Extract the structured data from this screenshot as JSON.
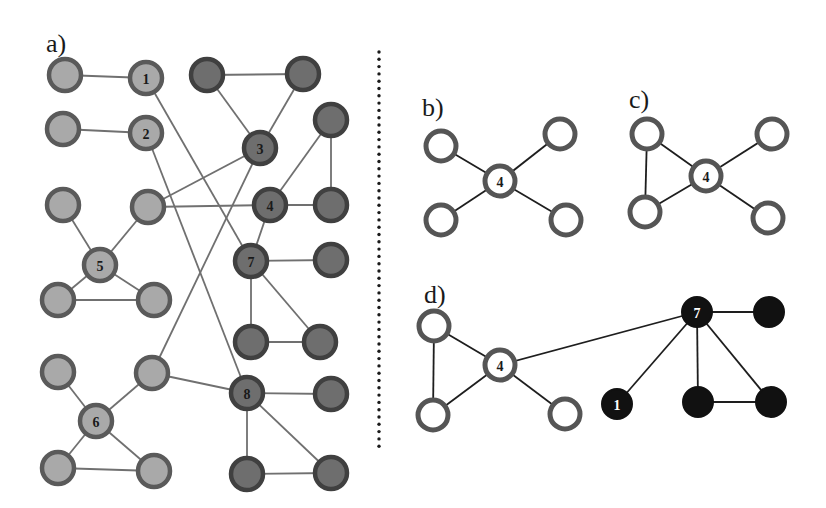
{
  "colors": {
    "background": "#ffffff",
    "edge_gray": "#707070",
    "edge_dark": "#1e1e1e",
    "light_fill": "#a9a9a9",
    "light_stroke": "#5a5a5a",
    "dark_fill": "#6e6e6e",
    "dark_stroke": "#404040",
    "open_fill": "#ffffff",
    "open_stroke": "#555555",
    "black_fill": "#111111",
    "divider": "#1a1a1a"
  },
  "divider": {
    "x": 379,
    "y1": 52,
    "y2": 450
  },
  "panels": [
    {
      "id": "a",
      "label": "a)",
      "label_pos": [
        46,
        52
      ],
      "node_radius": 16,
      "edge_width": 1.8,
      "edge_color": "edge_gray",
      "nodes": [
        {
          "id": "A1",
          "x": 65,
          "y": 75,
          "style": "light",
          "label": ""
        },
        {
          "id": "n1",
          "x": 146,
          "y": 78,
          "style": "light",
          "label": "1"
        },
        {
          "id": "D1",
          "x": 207,
          "y": 75,
          "style": "dark",
          "label": ""
        },
        {
          "id": "D2",
          "x": 303,
          "y": 74,
          "style": "dark",
          "label": ""
        },
        {
          "id": "A2",
          "x": 63,
          "y": 129,
          "style": "light",
          "label": ""
        },
        {
          "id": "n2",
          "x": 146,
          "y": 133,
          "style": "light",
          "label": "2"
        },
        {
          "id": "n3",
          "x": 260,
          "y": 148,
          "style": "dark",
          "label": "3"
        },
        {
          "id": "D3",
          "x": 331,
          "y": 120,
          "style": "dark",
          "label": ""
        },
        {
          "id": "A3",
          "x": 63,
          "y": 205,
          "style": "light",
          "label": ""
        },
        {
          "id": "A4",
          "x": 148,
          "y": 207,
          "style": "light",
          "label": ""
        },
        {
          "id": "n4",
          "x": 270,
          "y": 205,
          "style": "dark",
          "label": "4"
        },
        {
          "id": "D4",
          "x": 331,
          "y": 205,
          "style": "dark",
          "label": ""
        },
        {
          "id": "n5",
          "x": 100,
          "y": 265,
          "style": "light",
          "label": "5"
        },
        {
          "id": "n7",
          "x": 251,
          "y": 261,
          "style": "dark",
          "label": "7"
        },
        {
          "id": "D5",
          "x": 331,
          "y": 260,
          "style": "dark",
          "label": ""
        },
        {
          "id": "A5",
          "x": 58,
          "y": 300,
          "style": "light",
          "label": ""
        },
        {
          "id": "A6",
          "x": 154,
          "y": 300,
          "style": "light",
          "label": ""
        },
        {
          "id": "D6",
          "x": 251,
          "y": 342,
          "style": "dark",
          "label": ""
        },
        {
          "id": "D7",
          "x": 320,
          "y": 342,
          "style": "dark",
          "label": ""
        },
        {
          "id": "A7",
          "x": 58,
          "y": 372,
          "style": "light",
          "label": ""
        },
        {
          "id": "A8",
          "x": 152,
          "y": 373,
          "style": "light",
          "label": ""
        },
        {
          "id": "n8",
          "x": 247,
          "y": 393,
          "style": "dark",
          "label": "8"
        },
        {
          "id": "D8",
          "x": 331,
          "y": 394,
          "style": "dark",
          "label": ""
        },
        {
          "id": "n6",
          "x": 96,
          "y": 421,
          "style": "light",
          "label": "6"
        },
        {
          "id": "A9",
          "x": 58,
          "y": 468,
          "style": "light",
          "label": ""
        },
        {
          "id": "A10",
          "x": 154,
          "y": 471,
          "style": "light",
          "label": ""
        },
        {
          "id": "D9",
          "x": 247,
          "y": 474,
          "style": "dark",
          "label": ""
        },
        {
          "id": "D10",
          "x": 331,
          "y": 473,
          "style": "dark",
          "label": ""
        }
      ],
      "edges": [
        [
          "A1",
          "n1"
        ],
        [
          "A2",
          "n2"
        ],
        [
          "D1",
          "D2"
        ],
        [
          "D1",
          "n3"
        ],
        [
          "D2",
          "n3"
        ],
        [
          "n1",
          "n7"
        ],
        [
          "n2",
          "n8"
        ],
        [
          "n3",
          "A4"
        ],
        [
          "n3",
          "A8"
        ],
        [
          "A4",
          "n4"
        ],
        [
          "n4",
          "D3"
        ],
        [
          "D3",
          "D4"
        ],
        [
          "n4",
          "D4"
        ],
        [
          "n4",
          "n7"
        ],
        [
          "A3",
          "n5"
        ],
        [
          "A4",
          "n5"
        ],
        [
          "n5",
          "A5"
        ],
        [
          "n5",
          "A6"
        ],
        [
          "A5",
          "A6"
        ],
        [
          "n7",
          "D5"
        ],
        [
          "n7",
          "D6"
        ],
        [
          "n7",
          "D7"
        ],
        [
          "D6",
          "D7"
        ],
        [
          "A8",
          "n8"
        ],
        [
          "n8",
          "D8"
        ],
        [
          "n8",
          "D9"
        ],
        [
          "n8",
          "D10"
        ],
        [
          "D9",
          "D10"
        ],
        [
          "A7",
          "n6"
        ],
        [
          "A8",
          "n6"
        ],
        [
          "n6",
          "A9"
        ],
        [
          "n6",
          "A10"
        ],
        [
          "A9",
          "A10"
        ]
      ]
    },
    {
      "id": "b",
      "label": "b)",
      "label_pos": [
        422,
        116
      ],
      "node_radius": 15,
      "edge_width": 1.8,
      "edge_color": "edge_dark",
      "nodes": [
        {
          "id": "c",
          "x": 500,
          "y": 181,
          "style": "open",
          "label": "4"
        },
        {
          "id": "tl",
          "x": 441,
          "y": 146,
          "style": "open",
          "label": ""
        },
        {
          "id": "tr",
          "x": 560,
          "y": 134,
          "style": "open",
          "label": ""
        },
        {
          "id": "bl",
          "x": 441,
          "y": 220,
          "style": "open",
          "label": ""
        },
        {
          "id": "br",
          "x": 566,
          "y": 220,
          "style": "open",
          "label": ""
        }
      ],
      "edges": [
        [
          "c",
          "tl"
        ],
        [
          "c",
          "tr"
        ],
        [
          "c",
          "bl"
        ],
        [
          "c",
          "br"
        ]
      ]
    },
    {
      "id": "c",
      "label": "c)",
      "label_pos": [
        629,
        108
      ],
      "node_radius": 15,
      "edge_width": 1.8,
      "edge_color": "edge_dark",
      "nodes": [
        {
          "id": "c",
          "x": 706,
          "y": 176,
          "style": "open",
          "label": "4"
        },
        {
          "id": "tl",
          "x": 647,
          "y": 134,
          "style": "open",
          "label": ""
        },
        {
          "id": "bl",
          "x": 645,
          "y": 212,
          "style": "open",
          "label": ""
        },
        {
          "id": "tr",
          "x": 772,
          "y": 134,
          "style": "open",
          "label": ""
        },
        {
          "id": "br",
          "x": 768,
          "y": 218,
          "style": "open",
          "label": ""
        }
      ],
      "edges": [
        [
          "c",
          "tl"
        ],
        [
          "c",
          "bl"
        ],
        [
          "tl",
          "bl"
        ],
        [
          "c",
          "tr"
        ],
        [
          "c",
          "br"
        ]
      ]
    },
    {
      "id": "d",
      "label": "d)",
      "label_pos": [
        424,
        303
      ],
      "node_radius": 15,
      "edge_width": 1.8,
      "edge_color": "edge_dark",
      "nodes": [
        {
          "id": "c",
          "x": 500,
          "y": 365,
          "style": "open",
          "label": "4"
        },
        {
          "id": "tl",
          "x": 434,
          "y": 326,
          "style": "open",
          "label": ""
        },
        {
          "id": "bl",
          "x": 433,
          "y": 415,
          "style": "open",
          "label": ""
        },
        {
          "id": "br",
          "x": 565,
          "y": 414,
          "style": "open",
          "label": ""
        },
        {
          "id": "n7",
          "x": 697,
          "y": 312,
          "style": "black",
          "label": "7"
        },
        {
          "id": "r1",
          "x": 769,
          "y": 312,
          "style": "black",
          "label": ""
        },
        {
          "id": "n1",
          "x": 617,
          "y": 404,
          "style": "black",
          "label": "1"
        },
        {
          "id": "bm",
          "x": 698,
          "y": 402,
          "style": "black",
          "label": ""
        },
        {
          "id": "brr",
          "x": 771,
          "y": 402,
          "style": "black",
          "label": ""
        }
      ],
      "edges": [
        [
          "c",
          "tl"
        ],
        [
          "c",
          "bl"
        ],
        [
          "tl",
          "bl"
        ],
        [
          "c",
          "br"
        ],
        [
          "c",
          "n7"
        ],
        [
          "n7",
          "r1"
        ],
        [
          "n7",
          "n1"
        ],
        [
          "n7",
          "bm"
        ],
        [
          "n7",
          "brr"
        ],
        [
          "bm",
          "brr"
        ]
      ]
    }
  ]
}
